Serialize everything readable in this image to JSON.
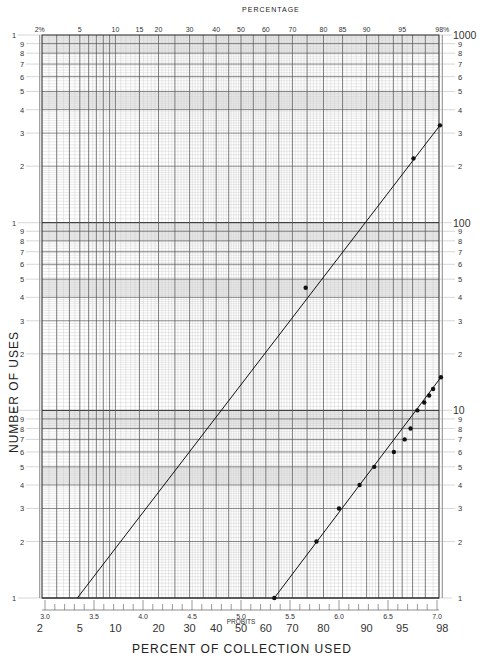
{
  "chart_data": {
    "type": "scatter",
    "title": "",
    "subtitle": "",
    "paper": "log-probability (3 cycle log × probability)",
    "xlabel": "PERCENT OF COLLECTION USED",
    "ylabel": "NUMBER OF USES",
    "top_axis_label": "PERCENTAGE",
    "probit_axis_label": "PROBITS",
    "x_scale": "probability",
    "y_scale": "log",
    "ylim": [
      1,
      1000
    ],
    "x_percent_range": [
      2,
      98
    ],
    "grid": true,
    "legend": null,
    "top_ticks": [
      "2%",
      "5",
      "10",
      "15",
      "20",
      "30",
      "40",
      "50",
      "60",
      "70",
      "80",
      "85",
      "90",
      "95",
      "98%"
    ],
    "bottom_percent_ticks": [
      "2",
      "5",
      "10",
      "20",
      "30",
      "40",
      "50",
      "60",
      "70",
      "80",
      "90",
      "95",
      "98"
    ],
    "probit_ticks": [
      "3.0",
      "3.5",
      "4.0",
      "4.5",
      "5.0",
      "5.5",
      "6.0",
      "6.5",
      "7.0"
    ],
    "left_y_ticks": [
      "1",
      "9",
      "8",
      "7",
      "6",
      "5",
      "4",
      "3",
      "2",
      "1",
      "9",
      "8",
      "7",
      "6",
      "5",
      "4",
      "3",
      "2",
      "1",
      "9",
      "8",
      "7",
      "6",
      "5",
      "4",
      "3",
      "2",
      "1"
    ],
    "right_y_decade_labels": [
      "1000",
      "100",
      "10",
      "1"
    ],
    "series": [
      {
        "name": "Upper line (fitted)",
        "line": {
          "from": {
            "probit": 3.33,
            "uses": 1
          },
          "to": {
            "probit": 7.03,
            "uses": 330
          }
        },
        "points": [
          {
            "probit": 5.66,
            "percent": 75,
            "uses": 45
          },
          {
            "probit": 6.76,
            "percent": 96.5,
            "uses": 220
          },
          {
            "probit": 7.03,
            "percent": 98,
            "uses": 330
          }
        ]
      },
      {
        "name": "Lower line (fitted)",
        "line": {
          "from": {
            "probit": 5.34,
            "uses": 1
          },
          "to": {
            "probit": 7.04,
            "uses": 15
          }
        },
        "points": [
          {
            "probit": 5.34,
            "percent": 63,
            "uses": 1
          },
          {
            "probit": 5.77,
            "percent": 78,
            "uses": 2
          },
          {
            "probit": 6.0,
            "percent": 84,
            "uses": 3
          },
          {
            "probit": 6.21,
            "percent": 88,
            "uses": 4
          },
          {
            "probit": 6.36,
            "percent": 91,
            "uses": 5
          },
          {
            "probit": 6.56,
            "percent": 94,
            "uses": 6
          },
          {
            "probit": 6.67,
            "percent": 95,
            "uses": 7
          },
          {
            "probit": 6.73,
            "percent": 96,
            "uses": 8
          },
          {
            "probit": 6.8,
            "percent": 96.5,
            "uses": 10
          },
          {
            "probit": 6.87,
            "percent": 97,
            "uses": 11
          },
          {
            "probit": 6.92,
            "percent": 97.3,
            "uses": 12
          },
          {
            "probit": 6.96,
            "percent": 97.6,
            "uses": 13
          },
          {
            "probit": 7.04,
            "percent": 98,
            "uses": 15
          }
        ]
      }
    ]
  }
}
